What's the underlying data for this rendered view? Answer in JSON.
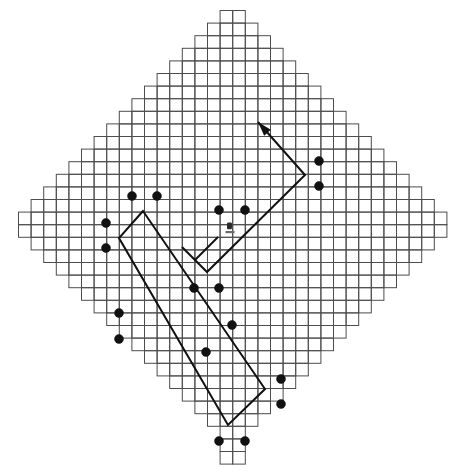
{
  "figure": {
    "title": "",
    "caption": "",
    "background_color": "#ffffff"
  },
  "chart_data": {
    "type": "scatter",
    "title": "",
    "subtitle": "",
    "xlabel": "",
    "ylabel": "",
    "legend": [],
    "annotations": [],
    "grid": {
      "shown": true,
      "description": "diamond-shaped lattice of square cells with stepped staircase boundary",
      "cell_size_px": 12.6,
      "origin_x_px": 18.5,
      "origin_y_px": 10.5,
      "columns": 34,
      "rows": 36,
      "stroke_color": "#4d4d4d",
      "row_spans": [
        [
          16,
          18
        ],
        [
          15,
          19
        ],
        [
          14,
          20
        ],
        [
          13,
          21
        ],
        [
          12,
          22
        ],
        [
          11,
          23
        ],
        [
          10,
          24
        ],
        [
          9,
          25
        ],
        [
          8,
          26
        ],
        [
          7,
          27
        ],
        [
          6,
          28
        ],
        [
          5,
          29
        ],
        [
          4,
          30
        ],
        [
          3,
          31
        ],
        [
          2,
          32
        ],
        [
          1,
          33
        ],
        [
          0,
          34
        ],
        [
          0,
          34
        ],
        [
          1,
          33
        ],
        [
          2,
          32
        ],
        [
          3,
          31
        ],
        [
          4,
          30
        ],
        [
          5,
          29
        ],
        [
          6,
          28
        ],
        [
          7,
          27
        ],
        [
          8,
          26
        ],
        [
          9,
          25
        ],
        [
          10,
          24
        ],
        [
          11,
          23
        ],
        [
          12,
          22
        ],
        [
          13,
          21
        ],
        [
          14,
          20
        ],
        [
          15,
          19
        ],
        [
          16,
          18
        ],
        [
          16,
          18
        ],
        [
          16,
          18
        ]
      ]
    },
    "axis_ranges": {
      "x": [
        0,
        465
      ],
      "y": [
        0,
        475
      ]
    },
    "series": [
      {
        "name": "markers",
        "marker": "filled-circle",
        "color": "#111111",
        "radius_px": 4.5,
        "points": [
          {
            "x": 132,
            "y": 196
          },
          {
            "x": 157,
            "y": 196
          },
          {
            "x": 106,
            "y": 223
          },
          {
            "x": 106,
            "y": 248
          },
          {
            "x": 219,
            "y": 210
          },
          {
            "x": 245,
            "y": 210
          },
          {
            "x": 319,
            "y": 161
          },
          {
            "x": 319,
            "y": 186
          },
          {
            "x": 194,
            "y": 288
          },
          {
            "x": 219,
            "y": 288
          },
          {
            "x": 119,
            "y": 313
          },
          {
            "x": 119,
            "y": 339
          },
          {
            "x": 232,
            "y": 325
          },
          {
            "x": 206,
            "y": 352
          },
          {
            "x": 281,
            "y": 379
          },
          {
            "x": 281,
            "y": 404
          },
          {
            "x": 219,
            "y": 441
          },
          {
            "x": 245,
            "y": 441
          }
        ]
      }
    ],
    "shapes": [
      {
        "name": "rotated-rectangle",
        "kind": "polygon",
        "stroke": "#111111",
        "stroke_width": 2,
        "fill": "none",
        "points": [
          [
            143,
            211
          ],
          [
            119,
            238
          ],
          [
            228,
            425
          ],
          [
            265,
            389
          ]
        ]
      },
      {
        "name": "v-arrow-polyline",
        "kind": "polyline",
        "stroke": "#111111",
        "stroke_width": 2,
        "fill": "none",
        "arrowhead_at": "start",
        "points": [
          [
            258,
            122
          ],
          [
            305,
            175
          ],
          [
            207,
            272
          ],
          [
            182,
            247
          ]
        ]
      },
      {
        "name": "short-tick-line",
        "kind": "polyline",
        "stroke": "#111111",
        "stroke_width": 2,
        "fill": "none",
        "points": [
          [
            218,
            237
          ],
          [
            195,
            260
          ]
        ]
      }
    ],
    "icons": [
      {
        "name": "robot-marker-icon",
        "x": 231,
        "y": 228,
        "width": 8,
        "height": 11
      }
    ]
  }
}
